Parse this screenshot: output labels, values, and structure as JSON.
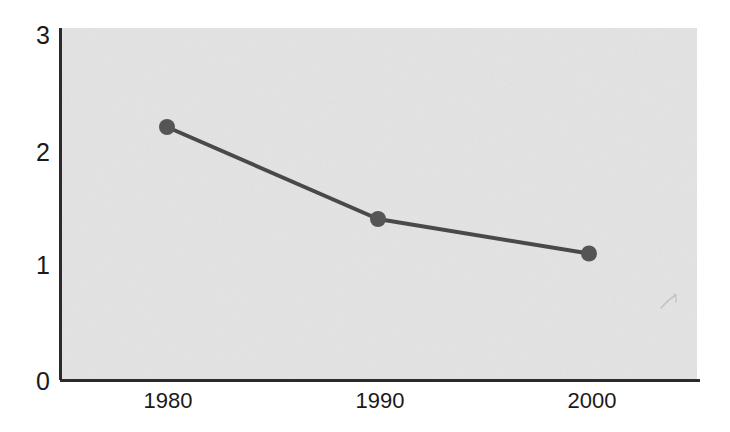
{
  "chart_data": {
    "type": "line",
    "title": "",
    "subtitle": "",
    "xlabel": "",
    "ylabel": "",
    "categories": [
      "1980",
      "1990",
      "2000"
    ],
    "x": [
      1980,
      1990,
      2000
    ],
    "values": [
      2.2,
      1.4,
      1.1
    ],
    "series": [
      {
        "name": "",
        "values": [
          2.2,
          1.4,
          1.1
        ]
      }
    ],
    "xlim": [
      1974,
      2006
    ],
    "ylim": [
      0,
      3
    ],
    "ytick_labels": [
      "0",
      "1",
      "2",
      "3"
    ],
    "ytick_values": [
      0,
      1,
      2,
      3
    ],
    "xtick_labels": [
      "1980",
      "1990",
      "2000"
    ],
    "grid": false,
    "legend": false,
    "legend_position": "none",
    "markers": "circle",
    "annotations": []
  },
  "style": {
    "plot_background": "#e3e3e3",
    "page_background": "#ffffff",
    "line_color": "#4a4a4a",
    "marker_color": "#555555",
    "axis_color": "#2b2b2b",
    "tick_label_color": "#1a1a1a"
  },
  "ytick_labels": {
    "t0": "0",
    "t1": "1",
    "t2": "2",
    "t3": "3"
  },
  "xtick_labels": {
    "t0": "1980",
    "t1": "1990",
    "t2": "2000"
  }
}
